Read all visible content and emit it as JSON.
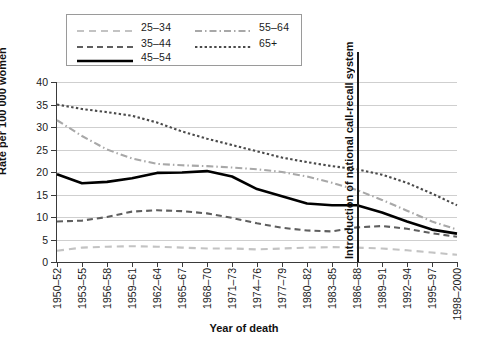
{
  "legend": {
    "items": [
      {
        "label": "25–34",
        "style": "dashed-light",
        "color": "#c3c3c3"
      },
      {
        "label": "35–44",
        "style": "dashed-dark",
        "color": "#5f5f5f"
      },
      {
        "label": "45–54",
        "style": "solid",
        "color": "#000000"
      },
      {
        "label": "55–64",
        "style": "dash-dot",
        "color": "#a8a8a8"
      },
      {
        "label": "65+",
        "style": "dotted",
        "color": "#4a4a4a"
      }
    ]
  },
  "annotation": {
    "text": "Introduction of national call-recall system",
    "at_category": "1986–88"
  },
  "chart_data": {
    "type": "line",
    "title": "",
    "xlabel": "Year of death",
    "ylabel": "Rate per 100 000 women",
    "ylim": [
      0,
      40
    ],
    "yticks": [
      0,
      5,
      10,
      15,
      20,
      25,
      30,
      35,
      40
    ],
    "grid": true,
    "legend_position": "top-left",
    "categories": [
      "1950–52",
      "1953–55",
      "1956–58",
      "1959–61",
      "1962–64",
      "1965–67",
      "1968–70",
      "1971–73",
      "1974–76",
      "1977–79",
      "1980–82",
      "1983–85",
      "1986–88",
      "1989–91",
      "1992–94",
      "1995–97",
      "1998–2000"
    ],
    "series": [
      {
        "name": "25–34",
        "color": "#c3c3c3",
        "values": [
          2.5,
          3.2,
          3.4,
          3.5,
          3.4,
          3.2,
          3.0,
          3.0,
          2.8,
          3.0,
          3.2,
          3.3,
          3.2,
          3.0,
          2.6,
          2.1,
          1.6
        ]
      },
      {
        "name": "35–44",
        "color": "#5f5f5f",
        "values": [
          9.0,
          9.2,
          10.0,
          11.2,
          11.5,
          11.3,
          10.8,
          9.8,
          8.6,
          7.6,
          7.0,
          6.8,
          7.7,
          8.0,
          7.4,
          6.4,
          5.6
        ]
      },
      {
        "name": "45–54",
        "color": "#000000",
        "values": [
          19.5,
          17.5,
          17.8,
          18.6,
          19.8,
          19.9,
          20.2,
          19.0,
          16.2,
          14.6,
          13.0,
          12.6,
          12.6,
          11.0,
          9.0,
          7.2,
          6.3
        ]
      },
      {
        "name": "55–64",
        "color": "#a8a8a8",
        "values": [
          31.5,
          28.0,
          25.0,
          23.0,
          21.8,
          21.5,
          21.3,
          21.0,
          20.6,
          20.0,
          19.0,
          17.6,
          16.0,
          13.8,
          11.4,
          9.0,
          7.2
        ]
      },
      {
        "name": "65+",
        "color": "#4a4a4a",
        "values": [
          35.0,
          34.0,
          33.3,
          32.5,
          31.0,
          29.0,
          27.4,
          26.0,
          24.6,
          23.2,
          22.2,
          21.3,
          20.6,
          19.4,
          17.6,
          15.2,
          12.6
        ]
      }
    ]
  }
}
